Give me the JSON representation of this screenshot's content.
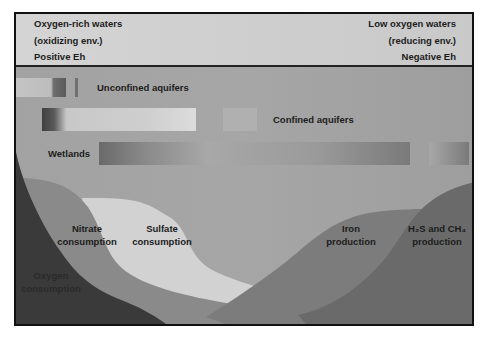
{
  "header": {
    "left": [
      "Oxygen-rich waters",
      "(oxidizing env.)",
      "Positive Eh"
    ],
    "right": [
      "Low oxygen waters",
      "(reducing env.)",
      "Negative Eh"
    ]
  },
  "environments": [
    {
      "label": "Unconfined aquifers"
    },
    {
      "label": "Confined aquifers"
    },
    {
      "label": "Wetlands"
    }
  ],
  "zones": [
    {
      "label_line1": "Oxygen",
      "label_line2": "consumption",
      "color": "#3a3a3a"
    },
    {
      "label_line1": "Nitrate",
      "label_line2": "consumption",
      "color": "#8a8a8a"
    },
    {
      "label_line1": "Sulfate",
      "label_line2": "consumption",
      "color": "#d2d2d2"
    },
    {
      "label_line1": "Iron",
      "label_line2": "production",
      "color": "#7c7c7c"
    },
    {
      "label_line1": "H₂S and CH₄",
      "label_line2": "production",
      "color": "#6a6a6a"
    }
  ]
}
